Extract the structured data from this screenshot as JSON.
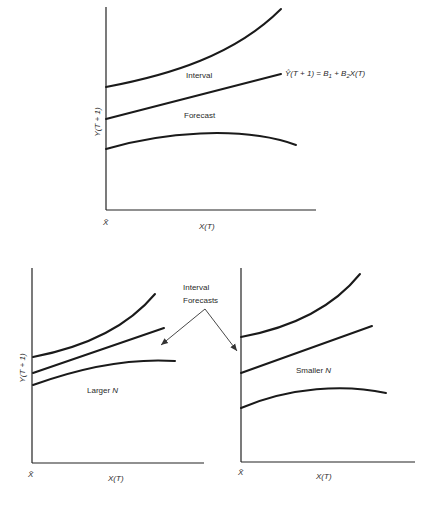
{
  "top_panel": {
    "y_axis_label": "Y(T + 1)",
    "x_axis_label": "X(T)",
    "origin_label": "X̄",
    "upper_band_label": "Interval",
    "lower_band_label": "Forecast",
    "equation": {
      "lhs": "Ŷ(T + 1) = B",
      "sub1": "1",
      "mid": " + B",
      "sub2": "2",
      "rhs": "X(T)"
    }
  },
  "bottom_left_panel": {
    "y_axis_label": "Y(T + 1)",
    "x_axis_label": "X(T)",
    "origin_label": "X̄",
    "caption_prefix": "Larger ",
    "caption_var": "N"
  },
  "bottom_right_panel": {
    "x_axis_label": "X(T)",
    "origin_label": "X̄",
    "caption_prefix": "Smaller ",
    "caption_var": "N"
  },
  "annotation": {
    "line1": "Interval",
    "line2": "Forecasts"
  },
  "colors": {
    "ink": "#1a1a1a",
    "background": "#ffffff"
  }
}
